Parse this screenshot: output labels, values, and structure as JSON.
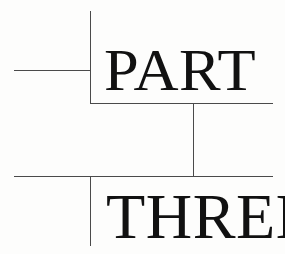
{
  "page": {
    "kind": "book-part-divider",
    "width": 285,
    "height": 254,
    "background_color": "#fdfdfc",
    "rule_color": "#4a4a4a",
    "text_color": "#111111"
  },
  "divider": {
    "label_primary": "PART",
    "label_secondary": "THREE",
    "full_text": "PART THREE"
  },
  "rules": [
    {
      "name": "vertical-rule-top",
      "orientation": "vertical",
      "x": 90,
      "y": 11,
      "length": 93
    },
    {
      "name": "horizontal-rule-upper-left",
      "orientation": "horizontal",
      "x": 14,
      "y": 70,
      "length": 77
    },
    {
      "name": "horizontal-rule-middle",
      "orientation": "horizontal",
      "x": 90,
      "y": 103,
      "length": 183
    },
    {
      "name": "vertical-rule-middle",
      "orientation": "vertical",
      "x": 193,
      "y": 103,
      "length": 74
    },
    {
      "name": "horizontal-rule-lower",
      "orientation": "horizontal",
      "x": 14,
      "y": 176,
      "length": 259
    },
    {
      "name": "vertical-rule-bottom",
      "orientation": "vertical",
      "x": 90,
      "y": 176,
      "length": 70
    }
  ]
}
